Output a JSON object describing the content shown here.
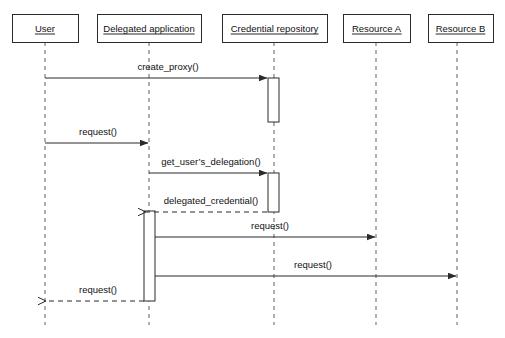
{
  "diagram": {
    "type": "uml-sequence-diagram",
    "canvas": {
      "width": 505,
      "height": 338
    },
    "colors": {
      "background": "#ffffff",
      "box_stroke": "#2b2b2b",
      "lifeline_stroke": "#6f6f6f",
      "text": "#111111"
    },
    "participants": [
      {
        "id": "user",
        "label": "User",
        "box_x": 12,
        "box_y": 14,
        "box_w": 66,
        "box_h": 28,
        "lifeline_x": 45
      },
      {
        "id": "delegated-application",
        "label": "Delegated application",
        "box_x": 97,
        "box_y": 14,
        "box_w": 104,
        "box_h": 28,
        "lifeline_x": 149
      },
      {
        "id": "credential-repository",
        "label": "Credential repository",
        "box_x": 222,
        "box_y": 14,
        "box_w": 105,
        "box_h": 28,
        "lifeline_x": 274
      },
      {
        "id": "resource-a",
        "label": "Resource A",
        "box_x": 343,
        "box_y": 14,
        "box_w": 67,
        "box_h": 28,
        "lifeline_x": 376
      },
      {
        "id": "resource-b",
        "label": "Resource B",
        "box_x": 428,
        "box_y": 14,
        "box_w": 65,
        "box_h": 28,
        "lifeline_x": 457
      }
    ],
    "lifeline_bottom": 325,
    "activations": [
      {
        "id": "activation-credential-repository-1",
        "owner": "credential-repository",
        "x": 268,
        "y": 78,
        "w": 11,
        "h": 44
      },
      {
        "id": "activation-credential-repository-2",
        "owner": "credential-repository",
        "x": 268,
        "y": 173,
        "w": 11,
        "h": 39
      },
      {
        "id": "activation-delegated-application",
        "owner": "delegated-application",
        "x": 144,
        "y": 211,
        "w": 11,
        "h": 90
      }
    ],
    "messages": [
      {
        "id": "message-create-proxy",
        "label": "create_proxy()",
        "from": "user",
        "to": "credential-repository",
        "x1": 45,
        "x2": 267,
        "y": 78,
        "label_x": 168,
        "label_y": 70,
        "style": "solid",
        "direction": "right"
      },
      {
        "id": "message-request-user-to-app",
        "label": "request()",
        "from": "user",
        "to": "delegated-application",
        "x1": 45,
        "x2": 148,
        "y": 143,
        "label_x": 98,
        "label_y": 135,
        "style": "solid",
        "direction": "right"
      },
      {
        "id": "message-get-users-delegation",
        "label": "get_user’s_delegation()",
        "from": "delegated-application",
        "to": "credential-repository",
        "x1": 149,
        "x2": 267,
        "y": 173,
        "label_x": 211,
        "label_y": 165,
        "style": "solid",
        "direction": "right"
      },
      {
        "id": "message-delegated-credential",
        "label": "delegated_credential()",
        "from": "credential-repository",
        "to": "delegated-application",
        "x1": 267,
        "x2": 146,
        "y": 212,
        "label_x": 211,
        "label_y": 204,
        "style": "dashed",
        "direction": "left"
      },
      {
        "id": "message-request-app-to-resource-a",
        "label": "request()",
        "from": "delegated-application",
        "to": "resource-a",
        "x1": 155,
        "x2": 375,
        "y": 237,
        "label_x": 270,
        "label_y": 229,
        "style": "solid",
        "direction": "right"
      },
      {
        "id": "message-request-app-to-resource-b",
        "label": "request()",
        "from": "delegated-application",
        "to": "resource-b",
        "x1": 155,
        "x2": 456,
        "y": 276,
        "label_x": 313,
        "label_y": 268,
        "style": "solid",
        "direction": "right"
      },
      {
        "id": "message-request-app-to-user",
        "label": "request()",
        "from": "delegated-application",
        "to": "user",
        "x1": 144,
        "x2": 46,
        "y": 301,
        "label_x": 98,
        "label_y": 293,
        "style": "dashed",
        "direction": "left"
      }
    ]
  }
}
